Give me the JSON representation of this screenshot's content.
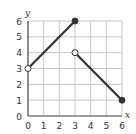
{
  "chart_data": {
    "type": "line",
    "title": "",
    "xlabel": "x",
    "ylabel": "y",
    "xlim": [
      0,
      6
    ],
    "ylim": [
      0,
      6
    ],
    "grid": true,
    "x_ticks": [
      "0",
      "1",
      "2",
      "3",
      "4",
      "5",
      "6"
    ],
    "y_ticks": [
      "0",
      "1",
      "2",
      "3",
      "4",
      "5",
      "6"
    ],
    "series": [
      {
        "name": "segment-1",
        "x": [
          0,
          3
        ],
        "y": [
          3,
          6
        ],
        "endpoints": [
          {
            "x": 0,
            "y": 3,
            "style": "open"
          },
          {
            "x": 3,
            "y": 6,
            "style": "closed"
          }
        ]
      },
      {
        "name": "segment-2",
        "x": [
          3,
          6
        ],
        "y": [
          4,
          1
        ],
        "endpoints": [
          {
            "x": 3,
            "y": 4,
            "style": "open"
          },
          {
            "x": 6,
            "y": 1,
            "style": "closed"
          }
        ]
      }
    ],
    "colors": {
      "line": "#333333",
      "grid": "#c8c8c8",
      "axis": "#555555"
    }
  }
}
